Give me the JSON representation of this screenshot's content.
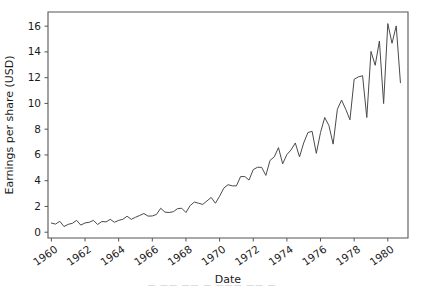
{
  "figure": {
    "background_color": "#ffffff",
    "line_color": "#4a4a4a",
    "axis_color": "#555555",
    "text_color": "#1a1a1a",
    "caption_partial": "— —— —— —  ——— —— —"
  },
  "chart_data": {
    "type": "line",
    "title": "",
    "xlabel": "Date",
    "ylabel": "Earnings per share (USD)",
    "xlim": [
      1959.8,
      1981.2
    ],
    "ylim": [
      -0.45,
      17.1
    ],
    "grid": false,
    "legend": null,
    "xticks": [
      1960,
      1962,
      1964,
      1966,
      1968,
      1970,
      1972,
      1974,
      1976,
      1978,
      1980
    ],
    "xticklabels": [
      "1960",
      "1962",
      "1964",
      "1966",
      "1968",
      "1970",
      "1972",
      "1974",
      "1976",
      "1978",
      "1980"
    ],
    "xticklabel_rotation": -35,
    "yticks": [
      0,
      2,
      4,
      6,
      8,
      10,
      12,
      14,
      16
    ],
    "yticklabels": [
      "0",
      "2",
      "4",
      "6",
      "8",
      "10",
      "12",
      "14",
      "16"
    ],
    "series": [
      {
        "name": "Earnings per share",
        "color": "#4a4a4a",
        "x": [
          1960.0,
          1960.25,
          1960.5,
          1960.75,
          1961.0,
          1961.25,
          1961.5,
          1961.75,
          1962.0,
          1962.25,
          1962.5,
          1962.75,
          1963.0,
          1963.25,
          1963.5,
          1963.75,
          1964.0,
          1964.25,
          1964.5,
          1964.75,
          1965.0,
          1965.25,
          1965.5,
          1965.75,
          1966.0,
          1966.25,
          1966.5,
          1966.75,
          1967.0,
          1967.25,
          1967.5,
          1967.75,
          1968.0,
          1968.25,
          1968.5,
          1968.75,
          1969.0,
          1969.25,
          1969.5,
          1969.75,
          1970.0,
          1970.25,
          1970.5,
          1970.75,
          1971.0,
          1971.25,
          1971.5,
          1971.75,
          1972.0,
          1972.25,
          1972.5,
          1972.75,
          1973.0,
          1973.25,
          1973.5,
          1973.75,
          1974.0,
          1974.25,
          1974.5,
          1974.75,
          1975.0,
          1975.25,
          1975.5,
          1975.75,
          1976.0,
          1976.25,
          1976.5,
          1976.75,
          1977.0,
          1977.25,
          1977.5,
          1977.75,
          1978.0,
          1978.25,
          1978.5,
          1978.75,
          1979.0,
          1979.25,
          1979.5,
          1979.75,
          1980.0,
          1980.25,
          1980.5,
          1980.75
        ],
        "values": [
          0.71,
          0.63,
          0.85,
          0.44,
          0.61,
          0.69,
          0.92,
          0.55,
          0.72,
          0.77,
          0.92,
          0.6,
          0.83,
          0.8,
          1.0,
          0.77,
          0.92,
          1.0,
          1.24,
          1.0,
          1.16,
          1.3,
          1.45,
          1.25,
          1.26,
          1.38,
          1.86,
          1.56,
          1.53,
          1.59,
          1.83,
          1.86,
          1.53,
          2.07,
          2.34,
          2.25,
          2.16,
          2.43,
          2.7,
          2.25,
          2.79,
          3.42,
          3.69,
          3.6,
          3.6,
          4.32,
          4.32,
          4.05,
          4.86,
          5.04,
          5.04,
          4.41,
          5.58,
          5.85,
          6.57,
          5.31,
          6.03,
          6.39,
          6.93,
          5.85,
          6.93,
          7.74,
          7.83,
          6.12,
          7.74,
          8.91,
          8.28,
          6.84,
          9.54,
          10.26,
          9.54,
          8.729,
          11.88,
          12.06,
          12.15,
          8.91,
          14.04,
          12.96,
          14.85,
          9.99,
          16.2,
          14.67,
          16.02,
          11.61
        ]
      }
    ]
  }
}
